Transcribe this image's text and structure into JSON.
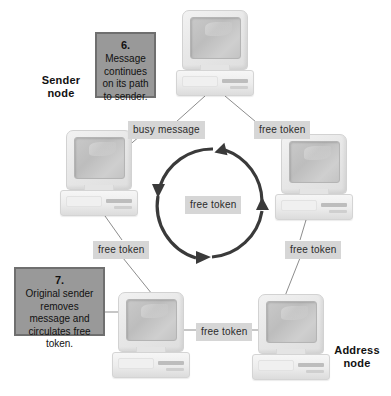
{
  "diagram": {
    "background_color": "#ffffff",
    "chip_color": "#d6d6d6",
    "stepbox_fill": "#999999",
    "stepbox_border": "#6f6f6f",
    "ring_color": "#3a3a3a"
  },
  "captions": [
    {
      "id": "sender",
      "line1": "Sender",
      "line2": "node"
    },
    {
      "id": "address",
      "line1": "Address",
      "line2": "node"
    }
  ],
  "steps": [
    {
      "id": "step6",
      "number": "6.",
      "text": "Message continues on its path to sender."
    },
    {
      "id": "step7",
      "number": "7.",
      "text": "Original sender removes message and circulates free token."
    }
  ],
  "link_labels": [
    {
      "id": "busy-message-top-left",
      "text": "busy  message"
    },
    {
      "id": "free-token-top-right",
      "text": "free token"
    },
    {
      "id": "free-token-center",
      "text": "free token"
    },
    {
      "id": "free-token-left",
      "text": "free token"
    },
    {
      "id": "free-token-right",
      "text": "free token"
    },
    {
      "id": "free-token-bottom",
      "text": "free token"
    },
    {
      "id": "free-token-bottom-left",
      "text": "free token"
    }
  ],
  "nodes": [
    {
      "id": "node-top",
      "role": "relay"
    },
    {
      "id": "node-left",
      "role": "sender"
    },
    {
      "id": "node-right",
      "role": "relay"
    },
    {
      "id": "node-bottom-left",
      "role": "relay"
    },
    {
      "id": "node-bottom-right",
      "role": "address"
    }
  ]
}
